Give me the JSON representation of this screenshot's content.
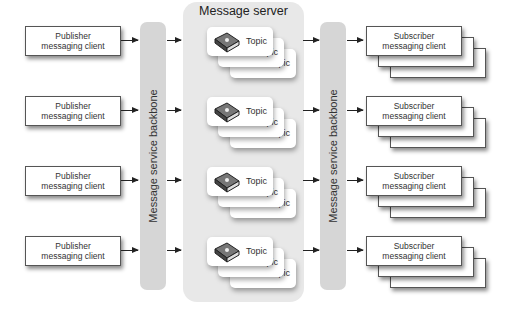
{
  "server": {
    "title": "Message server"
  },
  "backbones": [
    {
      "label": "Message service backbone"
    },
    {
      "label": "Message service backbone"
    }
  ],
  "publishers": [
    {
      "line1": "Publisher",
      "line2": "messaging client"
    },
    {
      "line1": "Publisher",
      "line2": "messaging client"
    },
    {
      "line1": "Publisher",
      "line2": "messaging client"
    },
    {
      "line1": "Publisher",
      "line2": "messaging client"
    }
  ],
  "topics": [
    {
      "label": "Topic",
      "icon": "book-icon"
    },
    {
      "label": "Topic",
      "icon": "book-icon"
    },
    {
      "label": "Topic",
      "icon": "book-icon"
    },
    {
      "label": "Topic",
      "icon": "book-icon"
    }
  ],
  "subscribers": [
    {
      "line1": "Subscriber",
      "line2": "messaging client"
    },
    {
      "line1": "Subscriber",
      "line2": "messaging client"
    },
    {
      "line1": "Subscriber",
      "line2": "messaging client"
    },
    {
      "line1": "Subscriber",
      "line2": "messaging client"
    }
  ],
  "colors": {
    "backbone": "#d6d6d6",
    "server": "#e8e8e8",
    "border": "#555555"
  }
}
